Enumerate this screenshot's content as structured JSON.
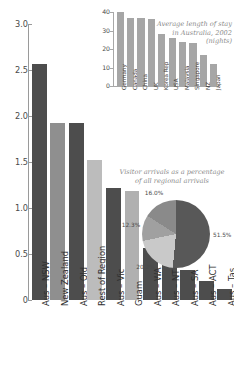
{
  "chart_data": [
    {
      "type": "bar",
      "id": "main-bar-chart",
      "title": "",
      "xlabel": "",
      "ylabel": "",
      "ylim": [
        0,
        3.0
      ],
      "yticks": [
        "0",
        "0.5",
        "1.0",
        "1.5",
        "2.0",
        "2.5",
        "3.0"
      ],
      "ytick_values": [
        0,
        0.5,
        1.0,
        1.5,
        2.0,
        2.5,
        3.0
      ],
      "grid": false,
      "legend": "none",
      "categories": [
        "Aus – NSW",
        "New Zealand",
        "Aus – Qld",
        "Rest of Region",
        "Aus – Vic",
        "Guam",
        "Aus – WA",
        "Aus – NT",
        "Aus – SA",
        "Aus – ACT",
        "Aus – Tas"
      ],
      "values": [
        2.57,
        1.92,
        1.92,
        1.52,
        1.22,
        1.18,
        0.56,
        0.43,
        0.33,
        0.21,
        0.12
      ],
      "colors": [
        "#4d4d4d",
        "#8f8f8f",
        "#4d4d4d",
        "#bcbcbc",
        "#4d4d4d",
        "#b0b0b0",
        "#4d4d4d",
        "#4d4d4d",
        "#4d4d4d",
        "#4d4d4d",
        "#4d4d4d"
      ]
    },
    {
      "type": "bar",
      "id": "inset-length-of-stay",
      "title": "Average length of stay in Australia, 2002 (nights)",
      "xlabel": "",
      "ylabel": "",
      "ylim": [
        0,
        40
      ],
      "yticks": [
        "0",
        "10",
        "20",
        "30",
        "40"
      ],
      "ytick_values": [
        0,
        10,
        20,
        30,
        40
      ],
      "grid": false,
      "legend": "none",
      "categories": [
        "Germany",
        "Canada",
        "China",
        "UK",
        "Korea Rep",
        "USA",
        "Malaysia",
        "Singapore",
        "NZ",
        "Japan"
      ],
      "values": [
        40,
        37,
        37,
        36,
        28,
        26,
        24,
        23,
        17,
        12
      ],
      "color": "#a6a6a6"
    },
    {
      "type": "pie",
      "id": "pie-regional-arrivals",
      "title": "Visitor arrivals as a percentage of all regional arrivals",
      "labels": [
        "51.5%",
        "20.2%",
        "12.3%",
        "16.0%"
      ],
      "values": [
        51.5,
        20.2,
        12.3,
        16.0
      ],
      "colors": [
        "#585858",
        "#c9c9c9",
        "#a0a0a0",
        "#8a8a8a"
      ],
      "legend": "none"
    }
  ],
  "main": {
    "yticks": [
      {
        "label": "3.0",
        "value": 3.0
      },
      {
        "label": "2.5",
        "value": 2.5
      },
      {
        "label": "2.0",
        "value": 2.0
      },
      {
        "label": "1.5",
        "value": 1.5
      },
      {
        "label": "1.0",
        "value": 1.0
      },
      {
        "label": "0.5",
        "value": 0.5
      },
      {
        "label": "0",
        "value": 0
      }
    ],
    "bars": [
      {
        "label": "Aus – NSW",
        "value": 2.57,
        "color": "#4d4d4d"
      },
      {
        "label": "New Zealand",
        "value": 1.92,
        "color": "#8f8f8f"
      },
      {
        "label": "Aus – Qld",
        "value": 1.92,
        "color": "#4d4d4d"
      },
      {
        "label": "Rest of Region",
        "value": 1.52,
        "color": "#bcbcbc"
      },
      {
        "label": "Aus – Vic",
        "value": 1.22,
        "color": "#4d4d4d"
      },
      {
        "label": "Guam",
        "value": 1.18,
        "color": "#b0b0b0"
      },
      {
        "label": "Aus – WA",
        "value": 0.56,
        "color": "#4d4d4d"
      },
      {
        "label": "Aus – NT",
        "value": 0.43,
        "color": "#4d4d4d"
      },
      {
        "label": "Aus – SA",
        "value": 0.33,
        "color": "#4d4d4d"
      },
      {
        "label": "Aus – ACT",
        "value": 0.21,
        "color": "#4d4d4d"
      },
      {
        "label": "Aus – Tas",
        "value": 0.12,
        "color": "#4d4d4d"
      }
    ]
  },
  "inset": {
    "title": "Average length of stay in Australia, 2002 (nights)",
    "yticks": [
      {
        "label": "40",
        "value": 40
      },
      {
        "label": "30",
        "value": 30
      },
      {
        "label": "20",
        "value": 20
      },
      {
        "label": "10",
        "value": 10
      },
      {
        "label": "0",
        "value": 0
      }
    ],
    "bars": [
      {
        "label": "Germany",
        "value": 40
      },
      {
        "label": "Canada",
        "value": 37
      },
      {
        "label": "China",
        "value": 37
      },
      {
        "label": "UK",
        "value": 36
      },
      {
        "label": "Korea Rep",
        "value": 28
      },
      {
        "label": "USA",
        "value": 26
      },
      {
        "label": "Malaysia",
        "value": 24
      },
      {
        "label": "Singapore",
        "value": 23
      },
      {
        "label": "NZ",
        "value": 17
      },
      {
        "label": "Japan",
        "value": 12
      }
    ]
  },
  "pie": {
    "title": "Visitor arrivals as a percentage of all regional arrivals",
    "slices": [
      {
        "label": "51.5%",
        "value": 51.5,
        "color": "#585858"
      },
      {
        "label": "20.2%",
        "value": 20.2,
        "color": "#c9c9c9"
      },
      {
        "label": "12.3%",
        "value": 12.3,
        "color": "#a0a0a0"
      },
      {
        "label": "16.0%",
        "value": 16.0,
        "color": "#8a8a8a"
      }
    ]
  }
}
